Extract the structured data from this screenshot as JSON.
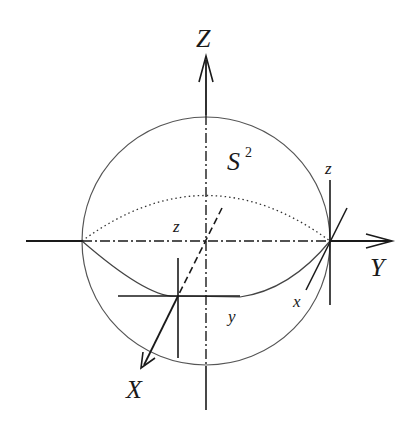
{
  "figure": {
    "type": "diagram"
  },
  "labels": {
    "global_axis_z": "Z",
    "global_axis_y": "Y",
    "global_axis_x": "X",
    "sphere": "S",
    "sphere_superscript": "2",
    "local_z_front": "z",
    "local_y_front": "y",
    "local_z_right": "z",
    "local_x_right": "x"
  },
  "colors": {
    "stroke": "#1a1a1a",
    "circle": "#555555",
    "background": "#ffffff"
  }
}
